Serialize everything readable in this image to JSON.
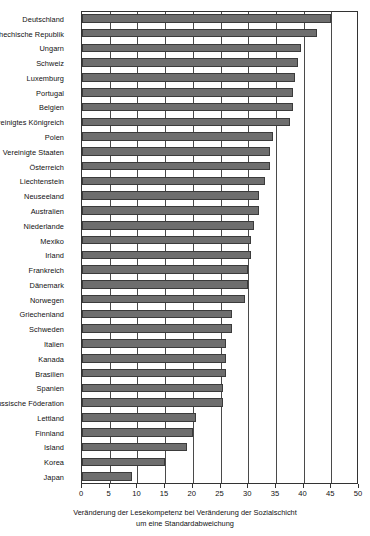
{
  "chart_data": {
    "type": "bar",
    "orientation": "horizontal",
    "title": "",
    "subtitle": "",
    "xlabel": "Veränderung der Lesekompetenz bei Veränderung der Sozialschicht um eine Standardabweichung",
    "xlabel_line1": "Veränderung der Lesekompetenz bei Veränderung der Sozialschicht",
    "xlabel_line2": "um eine Standardabweichung",
    "ylabel": "",
    "xlim": [
      0,
      50
    ],
    "xticks": [
      0,
      5,
      10,
      15,
      20,
      25,
      30,
      35,
      40,
      45,
      50
    ],
    "xtick_labels": [
      "0",
      "5",
      "10",
      "15",
      "20",
      "25",
      "30",
      "35",
      "40",
      "45",
      "50"
    ],
    "grid": true,
    "grid_axis": "x",
    "legend": false,
    "bar_color": "#6e6e6e",
    "bar_edge_color": "#3b3b3b",
    "categories": [
      "Deutschland",
      "Tschechische Republik",
      "Ungarn",
      "Schweiz",
      "Luxemburg",
      "Portugal",
      "Belgien",
      "Vereinigtes Königreich",
      "Polen",
      "Vereinigte Staaten",
      "Österreich",
      "Liechtenstein",
      "Neuseeland",
      "Australien",
      "Niederlande",
      "Mexiko",
      "Irland",
      "Frankreich",
      "Dänemark",
      "Norwegen",
      "Griechenland",
      "Schweden",
      "Italien",
      "Kanada",
      "Brasilien",
      "Spanien",
      "Russische Föderation",
      "Lettland",
      "Finnland",
      "Island",
      "Korea",
      "Japan"
    ],
    "values": [
      45.0,
      42.5,
      39.5,
      39.0,
      38.5,
      38.0,
      38.0,
      37.5,
      34.5,
      34.0,
      34.0,
      33.0,
      32.0,
      32.0,
      31.0,
      30.5,
      30.5,
      30.0,
      30.0,
      29.5,
      27.0,
      27.0,
      26.0,
      26.0,
      26.0,
      25.5,
      25.5,
      20.5,
      20.0,
      19.0,
      15.0,
      9.0
    ]
  }
}
